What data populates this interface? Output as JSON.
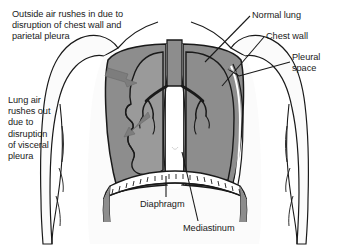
{
  "illustration": {
    "title": "Open pneumothorax chest cross-section",
    "colors": {
      "background": "#ffffff",
      "lung_fill": "#8d8d8d",
      "body_fill": "#fbfbfb",
      "mediastinum_fill": "#ffffff",
      "outline": "#1a1a1a",
      "arrow_fill": "#7d7d7d",
      "text": "#1a1a1a"
    }
  },
  "annotations": {
    "top_left_note": "Outside air rushes in due to\ndisruption of chest wall and\nparietal pleura",
    "middle_left_note": "Lung air\nrushes out\ndue to\ndisruption\nof visceral\npleura",
    "normal_lung": "Normal lung",
    "chest_wall": "Chest wall",
    "pleural_space": "Pleural\nspace",
    "diaphragm": "Diaphragm",
    "mediastinum": "Mediastinum"
  },
  "structures": [
    {
      "name": "collapsed-lung",
      "label": "Collapsed lung"
    },
    {
      "name": "normal-lung",
      "label": "Normal lung"
    },
    {
      "name": "trachea",
      "label": "Trachea"
    },
    {
      "name": "bronchi",
      "label": "Bronchi"
    },
    {
      "name": "diaphragm",
      "label": "Diaphragm"
    },
    {
      "name": "mediastinum",
      "label": "Mediastinum"
    },
    {
      "name": "chest-wall",
      "label": "Chest wall"
    },
    {
      "name": "pleural-space",
      "label": "Pleural space"
    },
    {
      "name": "torso",
      "label": "Torso outline"
    }
  ],
  "arrows": [
    {
      "name": "air-in-arrow",
      "direction": "right-down",
      "meaning": "Outside air rushes in"
    },
    {
      "name": "air-out-arrow",
      "direction": "left-down",
      "meaning": "Lung air rushes out"
    }
  ]
}
